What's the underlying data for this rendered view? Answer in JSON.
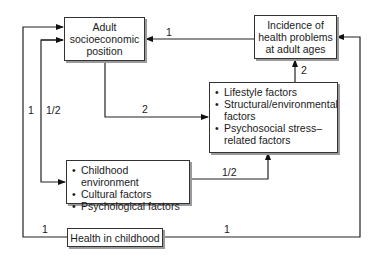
{
  "boxes": {
    "adult_sep": {
      "line1": "Adult",
      "line2": "socioeconomic",
      "line3": "position"
    },
    "incidence": {
      "line1": "Incidence of",
      "line2": "health problems",
      "line3": "at adult ages"
    },
    "mediators": {
      "items": [
        "Lifestyle factors",
        "Structural/environmental factors",
        "Psychosocial stress–related factors"
      ]
    },
    "childhood_factors": {
      "items": [
        "Childhood environment",
        "Cultural factors",
        "Psychological factors"
      ]
    },
    "health_childhood": {
      "label": "Health in childhood"
    }
  },
  "edge_labels": {
    "incidence_to_adult": "1",
    "adult_to_mediators": "2",
    "mediators_to_incidence": "2",
    "childhood_factors_to_mediators": "1/2",
    "health_to_adult": "1",
    "childhood_factors_to_adult": "1/2",
    "health_to_childhood_left": "1",
    "health_to_incidence": "1"
  }
}
